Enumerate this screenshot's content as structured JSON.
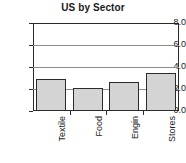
{
  "chart_data": {
    "type": "bar",
    "title": "US by Sector",
    "xlabel": "",
    "ylabel": "",
    "categories": [
      "Textile",
      "Food",
      "Engin",
      "Stores"
    ],
    "values": [
      2.9,
      2.05,
      2.6,
      3.45
    ],
    "series": [
      {
        "name": "US by Sector",
        "values": [
          2.9,
          2.05,
          2.6,
          3.45
        ]
      }
    ],
    "ylim": [
      0.0,
      8.0
    ],
    "yticks": [
      "0.0",
      "2.0",
      "4.0",
      "6.0",
      "8.0"
    ],
    "ytick_values": [
      0.0,
      2.0,
      4.0,
      6.0,
      8.0
    ],
    "grid": true,
    "legend": false,
    "legend_position": "none",
    "bar_fill_color": "#d4d4d4",
    "bar_edge_color": "#2b2b2b",
    "gridline_color": "#8d8d8d",
    "axis_color": "#2b2b2b",
    "background_color": "#ffffff",
    "text_color": "#1a1a1a",
    "xtick_label_rotation": 90
  }
}
